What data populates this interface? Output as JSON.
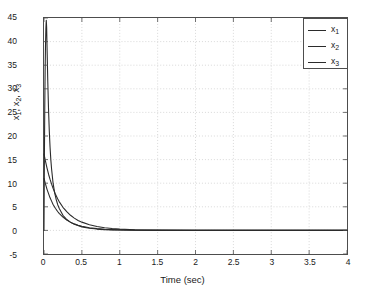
{
  "chart_data": {
    "type": "line",
    "title": "",
    "xlabel": "Time (sec)",
    "ylabel": "x_1, x_2, x_3",
    "ylabel_parts": [
      {
        "base": "x",
        "sub": "1",
        "sep": ", "
      },
      {
        "base": "x",
        "sub": "2",
        "sep": ", "
      },
      {
        "base": "x",
        "sub": "3",
        "sep": ""
      }
    ],
    "xlim": [
      0,
      4
    ],
    "ylim": [
      -5,
      45
    ],
    "xticks": [
      0,
      0.5,
      1,
      1.5,
      2,
      2.5,
      3,
      3.5,
      4
    ],
    "xtick_labels": [
      "0",
      "0.5",
      "1",
      "1.5",
      "2",
      "2.5",
      "3",
      "3.5",
      "4"
    ],
    "yticks": [
      -5,
      0,
      5,
      10,
      15,
      20,
      25,
      30,
      35,
      40,
      45
    ],
    "ytick_labels": [
      "-5",
      "0",
      "5",
      "10",
      "15",
      "20",
      "25",
      "30",
      "35",
      "40",
      "45"
    ],
    "grid": true,
    "grid_style": "dotted",
    "grid_color": "#c8c8c8",
    "axis_color": "#4d4d4d",
    "background": "#ffffff",
    "legend_position": "top-right",
    "legend_entries": [
      {
        "label": "x_1",
        "base": "x",
        "sub": "1",
        "color": "#2b2b2b"
      },
      {
        "label": "x_2",
        "base": "x",
        "sub": "2",
        "color": "#2b2b2b"
      },
      {
        "label": "x_3",
        "base": "x",
        "sub": "3",
        "color": "#2b2b2b"
      }
    ],
    "series": [
      {
        "name": "x_1",
        "color": "#2b2b2b",
        "note": "sharp spike to ~44.5 near t=0.03 then fast exponential decay to 0",
        "x": [
          0,
          0.005,
          0.01,
          0.015,
          0.02,
          0.025,
          0.03,
          0.035,
          0.04,
          0.05,
          0.06,
          0.07,
          0.08,
          0.09,
          0.1,
          0.12,
          0.14,
          0.16,
          0.18,
          0.2,
          0.25,
          0.3,
          0.35,
          0.4,
          0.5,
          0.6,
          0.7,
          0.8,
          0.9,
          1.0,
          1.2,
          1.5,
          2.0,
          2.5,
          3.0,
          3.5,
          4.0
        ],
        "y": [
          0,
          14.5,
          26.0,
          34.0,
          39.5,
          42.8,
          44.5,
          43.0,
          39.0,
          31.5,
          25.5,
          21.0,
          17.6,
          15.0,
          13.0,
          10.0,
          8.0,
          6.6,
          5.5,
          4.7,
          3.2,
          2.3,
          1.7,
          1.3,
          0.75,
          0.45,
          0.28,
          0.17,
          0.11,
          0.07,
          0.03,
          0.01,
          0.0,
          0.0,
          0.0,
          0.0,
          0.0
        ]
      },
      {
        "name": "x_2",
        "color": "#2b2b2b",
        "note": "starts near 16 at t=0, monotonic exponential decay to 0",
        "x": [
          0,
          0.02,
          0.04,
          0.06,
          0.08,
          0.1,
          0.12,
          0.15,
          0.18,
          0.2,
          0.25,
          0.3,
          0.35,
          0.4,
          0.45,
          0.5,
          0.6,
          0.7,
          0.8,
          0.9,
          1.0,
          1.2,
          1.5,
          2.0,
          2.5,
          3.0,
          3.5,
          4.0
        ],
        "y": [
          16.2,
          14.6,
          13.2,
          11.9,
          10.8,
          9.8,
          8.9,
          7.7,
          6.7,
          6.1,
          4.9,
          4.0,
          3.2,
          2.6,
          2.1,
          1.75,
          1.2,
          0.82,
          0.57,
          0.4,
          0.28,
          0.14,
          0.05,
          0.01,
          0.0,
          0.0,
          0.0,
          0.0
        ]
      },
      {
        "name": "x_3",
        "color": "#2b2b2b",
        "note": "starts near 11 at t=0, exponential decay to 0, slightly below x_2",
        "x": [
          0,
          0.02,
          0.04,
          0.06,
          0.08,
          0.1,
          0.12,
          0.15,
          0.18,
          0.2,
          0.25,
          0.3,
          0.35,
          0.4,
          0.45,
          0.5,
          0.6,
          0.7,
          0.8,
          0.9,
          1.0,
          1.2,
          1.5,
          2.0,
          2.5,
          3.0,
          3.5,
          4.0
        ],
        "y": [
          11.0,
          9.8,
          8.7,
          7.8,
          6.9,
          6.2,
          5.5,
          4.7,
          4.0,
          3.6,
          2.8,
          2.2,
          1.75,
          1.38,
          1.1,
          0.88,
          0.57,
          0.37,
          0.24,
          0.16,
          0.11,
          0.05,
          0.02,
          0.0,
          0.0,
          0.0,
          0.0,
          0.0
        ]
      }
    ]
  }
}
